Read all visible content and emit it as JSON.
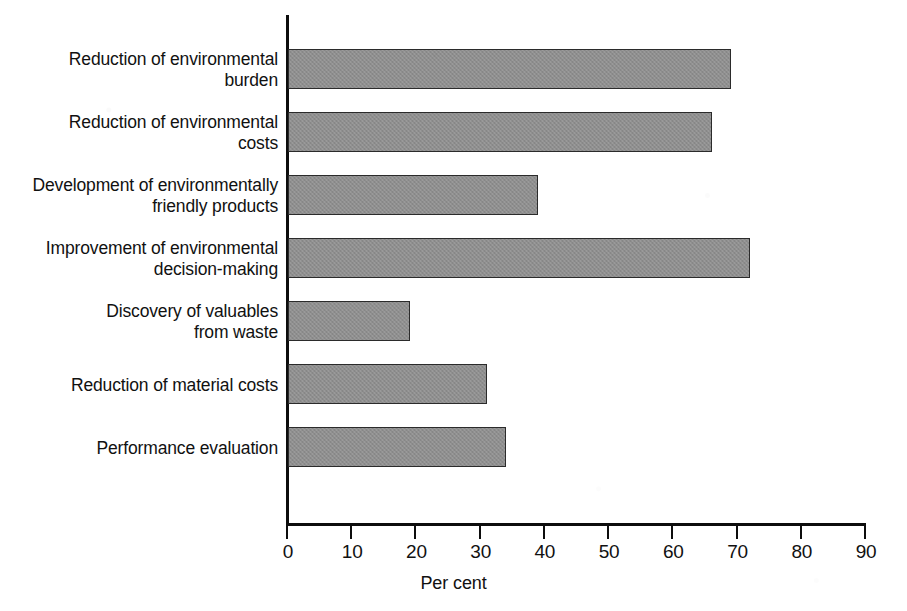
{
  "chart_data": {
    "type": "bar",
    "orientation": "horizontal",
    "title": "",
    "xlabel": "Per cent",
    "ylabel": "",
    "xlim": [
      0,
      90
    ],
    "xticks": [
      0,
      10,
      20,
      30,
      40,
      50,
      60,
      70,
      80,
      90
    ],
    "xtick_labels": [
      "0",
      "10",
      "20",
      "30",
      "40",
      "50",
      "60",
      "70",
      "80",
      "90"
    ],
    "grid": false,
    "legend": null,
    "bar_color": "#8e8e8e",
    "bar_edge_color": "#2b2b2b",
    "axis_color": "#0d0d0d",
    "categories": [
      "Reduction of environmental\nburden",
      "Reduction of environmental\ncosts",
      "Development of environmentally\nfriendly products",
      "Improvement of environmental\ndecision-making",
      "Discovery of valuables\nfrom waste",
      "Reduction of material costs",
      "Performance evaluation"
    ],
    "values": [
      69,
      66,
      39,
      72,
      19,
      31,
      34
    ]
  },
  "axis": {
    "x_title": "Per cent"
  }
}
